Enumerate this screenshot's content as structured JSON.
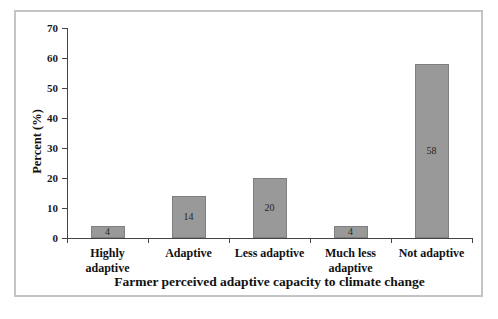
{
  "chart_data": {
    "type": "bar",
    "title": "",
    "xlabel": "Farmer perceived adaptive capacity to climate change",
    "ylabel": "Percent (%)",
    "categories": [
      "Highly adaptive",
      "Adaptive",
      "Less adaptive",
      "Much less adaptive",
      "Not adaptive"
    ],
    "values": [
      4,
      14,
      20,
      4,
      58
    ],
    "data_labels": [
      "4",
      "14",
      "20",
      "4",
      "58"
    ],
    "data_label_position": "center",
    "ylim": [
      0,
      70
    ],
    "yticks": [
      0,
      10,
      20,
      30,
      40,
      50,
      60,
      70
    ],
    "grid": false,
    "legend": null,
    "colors": {
      "bar_fill": "#999999",
      "bar_border": "#7f7f7f",
      "axis": "#444444",
      "frame_border": "#c4c4c4",
      "background": "#ffffff",
      "text": "#111111"
    }
  }
}
